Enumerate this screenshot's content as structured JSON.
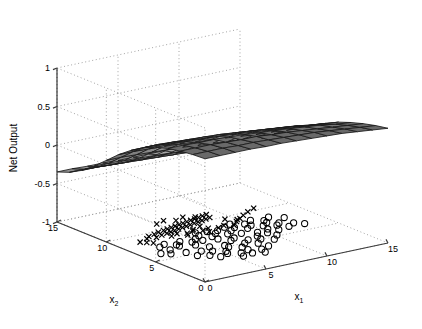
{
  "figure": {
    "kind": "matlab-3d-surface-with-floor-scatter",
    "background": "#ffffff",
    "ink": "#000000"
  },
  "chart_data": {
    "type": "surface",
    "title": "",
    "xlabel": "x_1",
    "ylabel": "x_2",
    "zlabel": "Net Output",
    "xlabel_base": "x",
    "xlabel_sub": "1",
    "ylabel_base": "x",
    "ylabel_sub": "2",
    "grid": true,
    "legend": "none",
    "xlim": [
      0,
      15
    ],
    "ylim": [
      0,
      15
    ],
    "zlim": [
      -1,
      1
    ],
    "xticks": [
      0,
      5,
      10,
      15
    ],
    "xtick_labels": [
      "0",
      "5",
      "10",
      "15"
    ],
    "yticks": [
      0,
      5,
      10,
      15
    ],
    "ytick_labels": [
      "0",
      "5",
      "10",
      "15"
    ],
    "zticks": [
      -1,
      -0.5,
      0,
      0.5,
      1
    ],
    "ztick_labels": [
      "-1",
      "-0.5",
      "0",
      "0.5",
      "1"
    ],
    "surface": {
      "colormap": "gray",
      "edge_color": "#1a1a1a",
      "nx": 13,
      "ny": 13,
      "description": "Smooth monotone neural-net response surface, high (~0.6) along the x2=15 back edge, dipping toward ~ -0.35 at the near x1=0,x2=0 corner and flattening near 0.1 at the x1=15 edge",
      "z_grid": [
        [
          0.6,
          0.6,
          0.6,
          0.6,
          0.59,
          0.59,
          0.58,
          0.57,
          0.56,
          0.55,
          0.53,
          0.51,
          0.49
        ],
        [
          0.59,
          0.59,
          0.59,
          0.58,
          0.58,
          0.57,
          0.56,
          0.55,
          0.54,
          0.52,
          0.5,
          0.48,
          0.46
        ],
        [
          0.57,
          0.57,
          0.57,
          0.56,
          0.55,
          0.55,
          0.53,
          0.52,
          0.5,
          0.48,
          0.46,
          0.44,
          0.42
        ],
        [
          0.54,
          0.54,
          0.53,
          0.53,
          0.52,
          0.51,
          0.49,
          0.48,
          0.46,
          0.44,
          0.42,
          0.39,
          0.37
        ],
        [
          0.49,
          0.49,
          0.48,
          0.47,
          0.46,
          0.45,
          0.44,
          0.42,
          0.4,
          0.38,
          0.35,
          0.33,
          0.31
        ],
        [
          0.42,
          0.42,
          0.41,
          0.4,
          0.39,
          0.38,
          0.36,
          0.34,
          0.32,
          0.3,
          0.28,
          0.25,
          0.23
        ],
        [
          0.32,
          0.32,
          0.31,
          0.3,
          0.29,
          0.27,
          0.26,
          0.24,
          0.22,
          0.2,
          0.18,
          0.16,
          0.14
        ],
        [
          0.2,
          0.2,
          0.19,
          0.18,
          0.17,
          0.15,
          0.14,
          0.12,
          0.1,
          0.08,
          0.07,
          0.05,
          0.04
        ],
        [
          0.06,
          0.06,
          0.05,
          0.04,
          0.03,
          0.02,
          0.0,
          -0.01,
          -0.03,
          -0.04,
          -0.05,
          -0.06,
          -0.07
        ],
        [
          -0.08,
          -0.08,
          -0.09,
          -0.1,
          -0.11,
          -0.12,
          -0.13,
          -0.15,
          -0.16,
          -0.17,
          -0.17,
          -0.18,
          -0.18
        ],
        [
          -0.2,
          -0.2,
          -0.21,
          -0.22,
          -0.23,
          -0.24,
          -0.25,
          -0.26,
          -0.26,
          -0.27,
          -0.27,
          -0.27,
          -0.27
        ],
        [
          -0.29,
          -0.29,
          -0.3,
          -0.31,
          -0.31,
          -0.32,
          -0.32,
          -0.33,
          -0.33,
          -0.33,
          -0.33,
          -0.33,
          -0.32
        ],
        [
          -0.35,
          -0.35,
          -0.36,
          -0.36,
          -0.37,
          -0.37,
          -0.37,
          -0.37,
          -0.37,
          -0.36,
          -0.36,
          -0.35,
          -0.34
        ]
      ]
    },
    "scatter": [
      {
        "name": "class-cross",
        "marker": "x",
        "color": "#000000",
        "z": -1,
        "points": [
          [
            2.6,
            9.1
          ],
          [
            3.0,
            9.4
          ],
          [
            3.3,
            9.0
          ],
          [
            3.6,
            9.6
          ],
          [
            3.9,
            9.2
          ],
          [
            4.1,
            9.8
          ],
          [
            4.4,
            9.3
          ],
          [
            4.6,
            9.9
          ],
          [
            4.8,
            9.4
          ],
          [
            5.0,
            10.0
          ],
          [
            5.2,
            9.5
          ],
          [
            5.4,
            10.1
          ],
          [
            5.6,
            9.6
          ],
          [
            5.8,
            10.2
          ],
          [
            6.0,
            9.7
          ],
          [
            6.2,
            10.3
          ],
          [
            6.4,
            9.8
          ],
          [
            6.6,
            10.4
          ],
          [
            6.8,
            9.9
          ],
          [
            7.0,
            10.5
          ],
          [
            7.2,
            10.0
          ],
          [
            7.4,
            10.6
          ],
          [
            7.6,
            10.1
          ],
          [
            7.8,
            10.7
          ],
          [
            8.0,
            10.2
          ],
          [
            8.2,
            10.8
          ],
          [
            8.4,
            10.3
          ],
          [
            8.6,
            10.9
          ],
          [
            8.8,
            10.4
          ],
          [
            9.0,
            11.0
          ],
          [
            4.3,
            8.7
          ],
          [
            4.9,
            8.9
          ],
          [
            5.5,
            8.6
          ],
          [
            6.1,
            8.8
          ],
          [
            6.7,
            8.5
          ],
          [
            7.3,
            8.7
          ],
          [
            7.9,
            8.4
          ],
          [
            8.5,
            8.6
          ],
          [
            9.1,
            8.3
          ],
          [
            9.7,
            8.8
          ],
          [
            10.3,
            9.2
          ],
          [
            10.9,
            9.6
          ],
          [
            2.1,
            8.5
          ],
          [
            2.4,
            8.2
          ],
          [
            1.8,
            8.8
          ],
          [
            11.6,
            10.0
          ],
          [
            12.4,
            10.4
          ],
          [
            5.1,
            11.2
          ],
          [
            5.9,
            11.5
          ],
          [
            6.6,
            11.1
          ],
          [
            7.4,
            11.4
          ],
          [
            8.1,
            11.0
          ],
          [
            9.4,
            9.6
          ],
          [
            10.0,
            9.1
          ],
          [
            6.3,
            9.0
          ],
          [
            7.1,
            9.3
          ],
          [
            5.3,
            8.3
          ],
          [
            6.9,
            8.1
          ]
        ]
      },
      {
        "name": "class-circle",
        "marker": "o",
        "color": "#000000",
        "z": -1,
        "points": [
          [
            1.4,
            6.2
          ],
          [
            1.9,
            5.8
          ],
          [
            2.4,
            6.5
          ],
          [
            2.9,
            5.5
          ],
          [
            3.4,
            6.8
          ],
          [
            3.9,
            5.2
          ],
          [
            4.4,
            6.4
          ],
          [
            4.9,
            5.6
          ],
          [
            5.4,
            6.9
          ],
          [
            5.9,
            5.3
          ],
          [
            6.4,
            6.6
          ],
          [
            6.9,
            5.9
          ],
          [
            7.4,
            6.2
          ],
          [
            7.9,
            5.4
          ],
          [
            8.4,
            6.7
          ],
          [
            8.9,
            5.7
          ],
          [
            9.4,
            6.3
          ],
          [
            9.9,
            5.9
          ],
          [
            10.4,
            6.5
          ],
          [
            10.9,
            6.0
          ],
          [
            11.4,
            6.8
          ],
          [
            11.9,
            6.2
          ],
          [
            12.6,
            6.6
          ],
          [
            13.1,
            6.1
          ],
          [
            2.2,
            7.3
          ],
          [
            2.8,
            7.6
          ],
          [
            3.4,
            7.1
          ],
          [
            4.0,
            7.5
          ],
          [
            4.6,
            7.0
          ],
          [
            5.2,
            7.4
          ],
          [
            5.8,
            7.8
          ],
          [
            6.4,
            7.2
          ],
          [
            7.0,
            7.6
          ],
          [
            7.6,
            7.1
          ],
          [
            8.2,
            7.5
          ],
          [
            8.8,
            7.9
          ],
          [
            9.4,
            7.3
          ],
          [
            10.0,
            7.7
          ],
          [
            10.6,
            7.2
          ],
          [
            11.2,
            7.6
          ],
          [
            11.8,
            7.1
          ],
          [
            3.1,
            4.6
          ],
          [
            3.8,
            4.2
          ],
          [
            4.5,
            4.8
          ],
          [
            5.2,
            4.3
          ],
          [
            5.9,
            4.9
          ],
          [
            6.6,
            4.4
          ],
          [
            7.3,
            5.0
          ],
          [
            8.0,
            4.5
          ],
          [
            8.7,
            5.1
          ],
          [
            9.4,
            4.6
          ],
          [
            10.1,
            5.2
          ],
          [
            4.2,
            3.6
          ],
          [
            5.0,
            3.9
          ],
          [
            5.8,
            3.5
          ],
          [
            6.6,
            3.8
          ],
          [
            7.4,
            3.4
          ],
          [
            8.2,
            3.7
          ],
          [
            6.0,
            8.4
          ],
          [
            6.8,
            8.2
          ],
          [
            7.5,
            8.0
          ],
          [
            8.3,
            8.3
          ],
          [
            9.0,
            8.6
          ],
          [
            9.8,
            8.1
          ],
          [
            10.6,
            8.5
          ],
          [
            11.3,
            8.0
          ],
          [
            12.0,
            8.4
          ],
          [
            12.8,
            7.8
          ],
          [
            5.5,
            2.9
          ],
          [
            6.4,
            3.1
          ],
          [
            7.2,
            2.8
          ]
        ]
      }
    ]
  },
  "axes": {
    "z_axis_name": "Net Output"
  }
}
